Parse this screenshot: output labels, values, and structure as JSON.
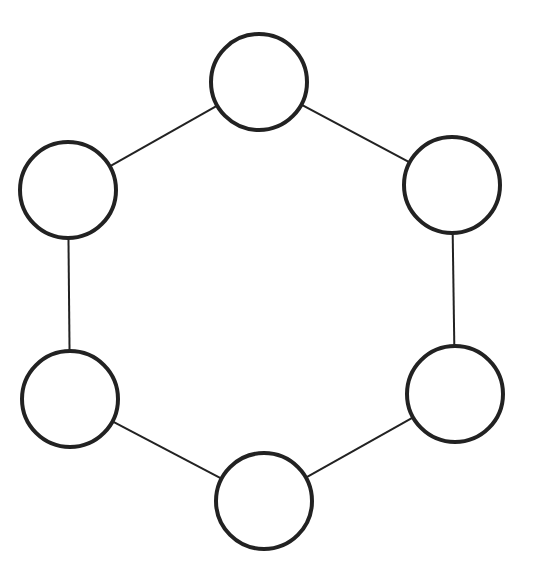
{
  "diagram": {
    "type": "cycle-graph",
    "colors": {
      "background": "#ffffff",
      "stroke": "#222222",
      "fill": "#ffffff"
    },
    "node_radius": 48,
    "node_stroke_width": 4,
    "edge_stroke_width": 2,
    "nodes": [
      {
        "id": "n1",
        "position": "top",
        "cx": 259,
        "cy": 82
      },
      {
        "id": "n2",
        "position": "upper-right",
        "cx": 452,
        "cy": 185
      },
      {
        "id": "n3",
        "position": "lower-right",
        "cx": 455,
        "cy": 394
      },
      {
        "id": "n4",
        "position": "bottom",
        "cx": 264,
        "cy": 501
      },
      {
        "id": "n5",
        "position": "lower-left",
        "cx": 70,
        "cy": 399
      },
      {
        "id": "n6",
        "position": "upper-left",
        "cx": 68,
        "cy": 190
      }
    ],
    "edges": [
      {
        "from": "n1",
        "to": "n2"
      },
      {
        "from": "n2",
        "to": "n3"
      },
      {
        "from": "n3",
        "to": "n4"
      },
      {
        "from": "n4",
        "to": "n5"
      },
      {
        "from": "n5",
        "to": "n6"
      },
      {
        "from": "n6",
        "to": "n1"
      }
    ]
  }
}
